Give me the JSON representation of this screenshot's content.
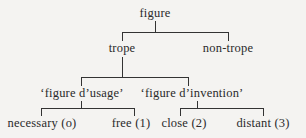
{
  "tree": {
    "root": {
      "label": "figure"
    },
    "level1": [
      {
        "label": "trope"
      },
      {
        "label": "non-trope"
      }
    ],
    "level2": [
      {
        "label": "‘figure d’usage’"
      },
      {
        "label": "‘figure d’invention’"
      }
    ],
    "level3": [
      {
        "label": "necessary (o)"
      },
      {
        "label": "free (1)"
      },
      {
        "label": "close (2)"
      },
      {
        "label": "distant (3)"
      }
    ]
  },
  "colors": {
    "background": "#f4f3f1",
    "ink": "#2a2a2a"
  }
}
